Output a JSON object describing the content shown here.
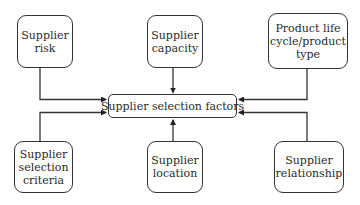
{
  "diagram": {
    "type": "hub-and-spoke flow diagram",
    "center": {
      "label": "Supplier selection factors"
    },
    "nodes": [
      {
        "id": "risk",
        "label": "Supplier\nrisk",
        "position": "top-left"
      },
      {
        "id": "capacity",
        "label": "Supplier\ncapacity",
        "position": "top-center"
      },
      {
        "id": "lifecycle",
        "label": "Product life\ncycle/product\ntype",
        "position": "top-right"
      },
      {
        "id": "criteria",
        "label": "Supplier\nselection\ncriteria",
        "position": "bottom-left"
      },
      {
        "id": "location",
        "label": "Supplier\nlocation",
        "position": "bottom-center"
      },
      {
        "id": "relationship",
        "label": "Supplier\nrelationship",
        "position": "bottom-right"
      }
    ],
    "edges": [
      {
        "from": "risk",
        "to": "center"
      },
      {
        "from": "capacity",
        "to": "center"
      },
      {
        "from": "lifecycle",
        "to": "center"
      },
      {
        "from": "criteria",
        "to": "center"
      },
      {
        "from": "location",
        "to": "center"
      },
      {
        "from": "relationship",
        "to": "center"
      }
    ],
    "colors": {
      "line": "#333333",
      "background": "#ffffff",
      "text": "#2a2a2a"
    }
  }
}
